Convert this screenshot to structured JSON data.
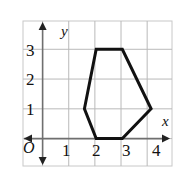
{
  "figure": {
    "origin_label": "O",
    "x_axis_label": "x",
    "y_axis_label": "y",
    "x_tick_labels": [
      "1",
      "2",
      "3",
      "4"
    ],
    "y_tick_labels": [
      "1",
      "2",
      "3"
    ],
    "colors": {
      "grid": "#b9b9b9",
      "axis": "#6f6f6f",
      "shape_stroke": "#111111",
      "background": "#ffffff",
      "frame": "#c8c8c8"
    }
  },
  "chart_data": {
    "type": "scatter",
    "title": "",
    "xlabel": "x",
    "ylabel": "y",
    "xlim": [
      -0.75,
      4.95
    ],
    "ylim": [
      -0.92,
      3.95
    ],
    "grid": true,
    "grid_step": 1,
    "legend": "none",
    "x_ticks": [
      1,
      2,
      3,
      4
    ],
    "y_ticks": [
      1,
      2,
      3
    ],
    "annotations": [
      "O"
    ],
    "series": [
      {
        "name": "hexagon",
        "kind": "polygon",
        "closed": true,
        "stroke_width": 3,
        "fill": "none",
        "points": [
          [
            1.6,
            1.0
          ],
          [
            2.05,
            3.0
          ],
          [
            3.05,
            3.0
          ],
          [
            4.15,
            1.0
          ],
          [
            3.05,
            0.0
          ],
          [
            2.05,
            0.0
          ]
        ]
      }
    ]
  }
}
